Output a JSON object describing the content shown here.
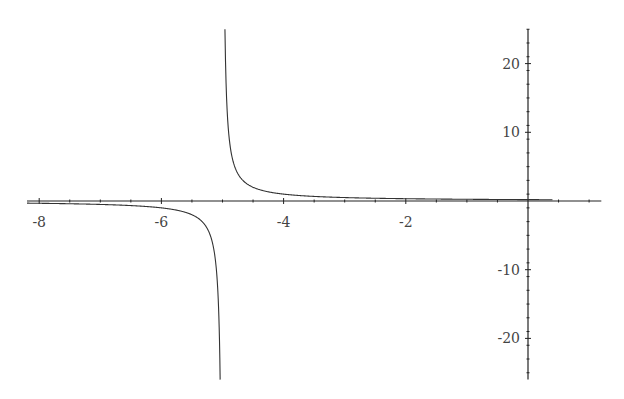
{
  "chart_data": {
    "type": "line",
    "title": "",
    "xlabel": "",
    "ylabel": "",
    "function": "1/(x+5)",
    "xlim": [
      -8.2,
      1.2
    ],
    "ylim": [
      -26,
      25
    ],
    "grid": false,
    "legend": null,
    "x_ticks": [
      -8,
      -6,
      -4,
      -2
    ],
    "y_ticks": [
      20,
      10,
      -10,
      -20
    ],
    "x_tick_labels": [
      "-8",
      "-6",
      "-4",
      "-2"
    ],
    "y_tick_labels": [
      "20",
      "10",
      "-10",
      "-20"
    ],
    "series": [
      {
        "name": "y = 1/(x+5)",
        "asymptote_x": -5,
        "color": "#333333"
      }
    ]
  },
  "colors": {
    "axis": "#222222",
    "curve": "#333333",
    "label": "#444444"
  }
}
